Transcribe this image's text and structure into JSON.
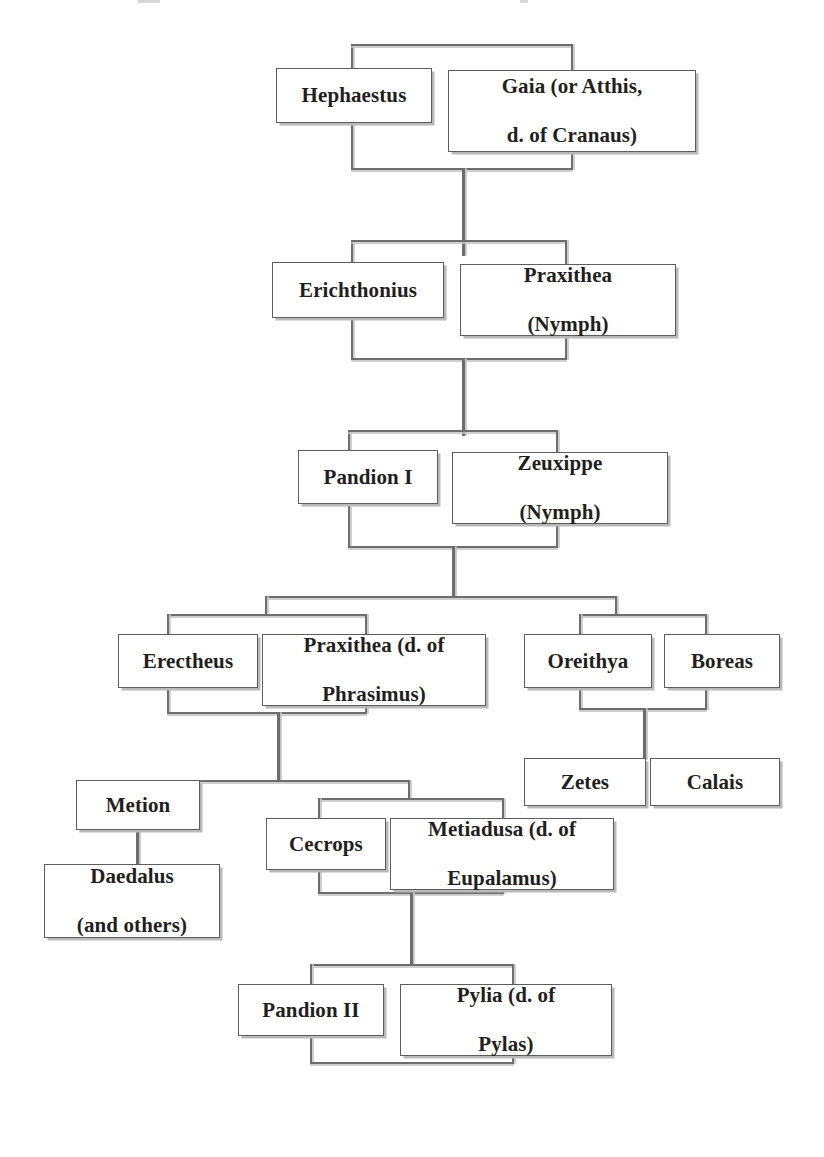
{
  "diagram": {
    "type": "genealogy-tree",
    "generations": 6,
    "colors": {
      "box_border": "#5d5d5d",
      "box_fill": "#ffffff",
      "connector": "#6d6d6d",
      "shadow": "#b9b9b9",
      "text": "#231f20",
      "page_background": "#ffffff"
    },
    "nodes": {
      "hephaestus": "Hephaestus",
      "gaia": "Gaia (or Atthis,\nd. of Cranaus)",
      "gaia_line1": "Gaia (or Atthis,",
      "gaia_line2": "d. of Cranaus)",
      "erichthonius": "Erichthonius",
      "praxithea_nymph_line1": "Praxithea",
      "praxithea_nymph_line2": "(Nymph)",
      "pandion_i": "Pandion I",
      "zeuxippe_line1": "Zeuxippe",
      "zeuxippe_line2": "(Nymph)",
      "erectheus": "Erectheus",
      "praxithea_phrasimus_line1": "Praxithea (d. of",
      "praxithea_phrasimus_line2": "Phrasimus)",
      "oreithya": "Oreithya",
      "boreas": "Boreas",
      "zetes": "Zetes",
      "calais": "Calais",
      "metion": "Metion",
      "daedalus_line1": "Daedalus",
      "daedalus_line2": "(and others)",
      "cecrops": "Cecrops",
      "metiadusa_line1": "Metiadusa (d. of",
      "metiadusa_line2": "Eupalamus)",
      "pandion_ii": "Pandion II",
      "pylia_line1": "Pylia (d. of",
      "pylia_line2": "Pylas)"
    },
    "unions": [
      {
        "spouses": [
          "Hephaestus",
          "Gaia (or Atthis, d. of Cranaus)"
        ],
        "children": [
          "Erichthonius"
        ]
      },
      {
        "spouses": [
          "Erichthonius",
          "Praxithea (Nymph)"
        ],
        "children": [
          "Pandion I"
        ]
      },
      {
        "spouses": [
          "Pandion I",
          "Zeuxippe (Nymph)"
        ],
        "children": [
          "Erectheus",
          "Oreithya"
        ]
      },
      {
        "spouses": [
          "Erectheus",
          "Praxithea (d. of Phrasimus)"
        ],
        "children": [
          "Metion",
          "Cecrops"
        ]
      },
      {
        "spouses": [
          "Oreithya",
          "Boreas"
        ],
        "children": [
          "Zetes",
          "Calais"
        ]
      },
      {
        "spouses": [
          "Metion"
        ],
        "children": [
          "Daedalus (and others)"
        ]
      },
      {
        "spouses": [
          "Cecrops",
          "Metiadusa (d. of Eupalamus)"
        ],
        "children": [
          "Pandion II"
        ]
      },
      {
        "spouses": [
          "Pandion II",
          "Pylia (d. of Pylas)"
        ],
        "children": []
      }
    ]
  }
}
